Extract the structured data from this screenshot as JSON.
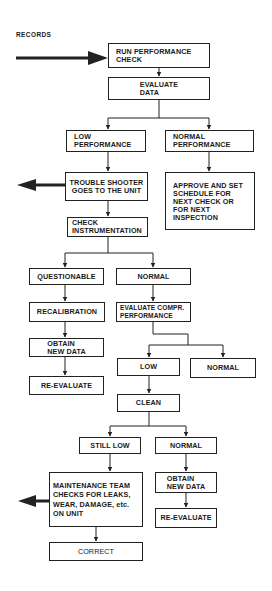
{
  "diagram": {
    "type": "flowchart",
    "input_label": "RECORDS",
    "nodes": {
      "run_check": "RUN PERFORMANCE\nCHECK",
      "evaluate_data": "EVALUATE\nDATA",
      "low_performance": "LOW\nPERFORMANCE",
      "normal_performance": "NORMAL\nPERFORMANCE",
      "trouble_shooter": "TROUBLE SHOOTER\nGOES TO THE UNIT",
      "approve": "APPROVE AND SET\nSCHEDULE FOR\nNEXT CHECK OR\nFOR NEXT\nINSPECTION",
      "check_instrumentation": "CHECK\nINSTRUMENTATION",
      "questionable": "QUESTIONABLE",
      "normal_instr": "NORMAL",
      "recalibration": "RECALIBRATION",
      "evaluate_compr": "EVALUATE COMPR.\nPERFORMANCE",
      "obtain_new_data_left": "OBTAIN\nNEW DATA",
      "re_evaluate_left": "RE-EVALUATE",
      "low": "LOW",
      "normal_compr": "NORMAL",
      "clean": "CLEAN",
      "still_low": "STILL LOW",
      "normal_after_clean": "NORMAL",
      "maintenance": "MAINTENANCE TEAM\nCHECKS FOR LEAKS,\nWEAR, DAMAGE,  etc.\nON UNIT",
      "obtain_new_data_right": "OBTAIN\nNEW DATA",
      "re_evaluate_right": "RE-EVALUATE",
      "correct": "CORRECT"
    },
    "edges": [
      [
        "RECORDS",
        "run_check"
      ],
      [
        "run_check",
        "evaluate_data"
      ],
      [
        "evaluate_data",
        "low_performance"
      ],
      [
        "evaluate_data",
        "normal_performance"
      ],
      [
        "low_performance",
        "trouble_shooter"
      ],
      [
        "normal_performance",
        "approve"
      ],
      [
        "trouble_shooter",
        "check_instrumentation"
      ],
      [
        "trouble_shooter",
        "(outgoing arrow left)"
      ],
      [
        "check_instrumentation",
        "questionable"
      ],
      [
        "check_instrumentation",
        "normal_instr"
      ],
      [
        "questionable",
        "recalibration"
      ],
      [
        "recalibration",
        "obtain_new_data_left"
      ],
      [
        "obtain_new_data_left",
        "re_evaluate_left"
      ],
      [
        "normal_instr",
        "evaluate_compr"
      ],
      [
        "evaluate_compr",
        "low"
      ],
      [
        "evaluate_compr",
        "normal_compr"
      ],
      [
        "low",
        "clean"
      ],
      [
        "clean",
        "still_low"
      ],
      [
        "clean",
        "normal_after_clean"
      ],
      [
        "still_low",
        "maintenance"
      ],
      [
        "maintenance",
        "(outgoing arrow left)"
      ],
      [
        "maintenance",
        "correct"
      ],
      [
        "normal_after_clean",
        "obtain_new_data_right"
      ],
      [
        "obtain_new_data_right",
        "re_evaluate_right"
      ]
    ],
    "colors": {
      "ink": "#1a1a1a",
      "background": "#ffffff"
    }
  }
}
